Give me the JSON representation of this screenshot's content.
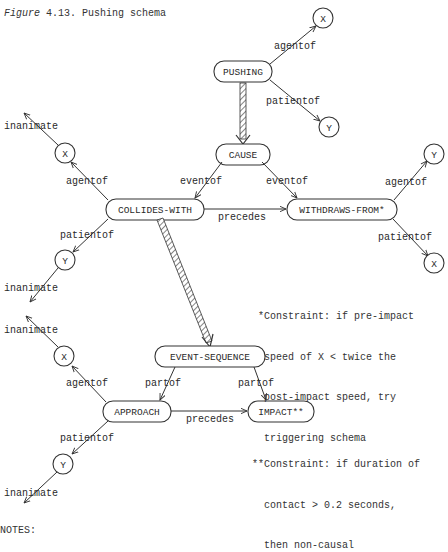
{
  "caption": {
    "figure_label": "Figure",
    "figure_number": "4.13.",
    "title": "Pushing schema"
  },
  "nodes": {
    "pushing": "PUSHING",
    "cause": "CAUSE",
    "collides_with": "COLLIDES-WITH",
    "withdraws_from": "WITHDRAWS-FROM*",
    "event_sequence": "EVENT-SEQUENCE",
    "approach": "APPROACH",
    "impact": "IMPACT**",
    "x": "X",
    "y": "Y"
  },
  "edge_labels": {
    "agentof": "agentof",
    "patientof": "patientof",
    "eventof": "eventof",
    "precedes": "precedes",
    "partof": "partof",
    "inanimate": "inanimate"
  },
  "notes": {
    "constraint1": [
      "*Constraint: if pre-impact",
      " speed of X < twice the",
      " post-impact speed, try",
      " triggering schema"
    ],
    "constraint2": [
      "**Constraint: if duration of",
      "  contact > 0.2 seconds,",
      "  then non-causal"
    ],
    "footer": "NOTES:"
  }
}
